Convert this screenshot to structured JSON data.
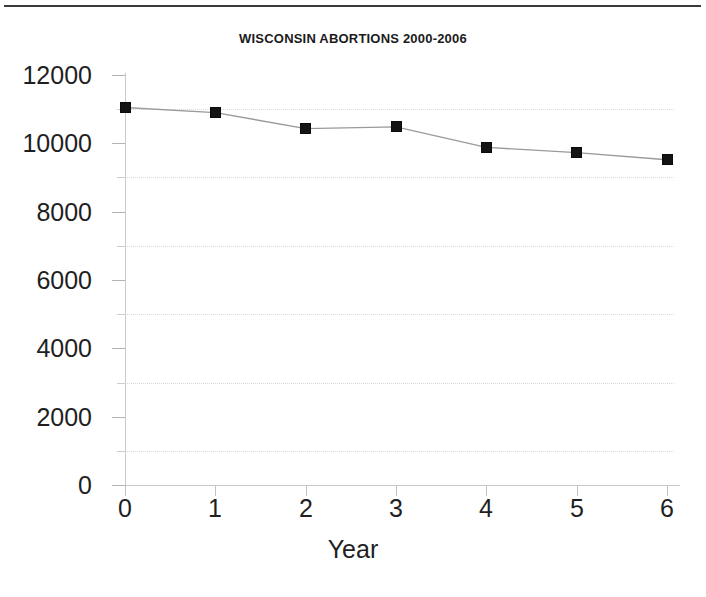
{
  "figure": {
    "top_rule": "horizontal-rule",
    "background": "#ffffff"
  },
  "chart_data": {
    "type": "line",
    "title": "WISCONSIN ABORTIONS 2000-2006",
    "xlabel": "Year",
    "ylabel": "",
    "x": [
      0,
      1,
      2,
      3,
      4,
      5,
      6
    ],
    "values": [
      11050,
      10900,
      10430,
      10480,
      9880,
      9730,
      9520
    ],
    "series": [
      {
        "name": "Wisconsin abortions",
        "values": [
          11050,
          10900,
          10430,
          10480,
          9880,
          9730,
          9520
        ]
      }
    ],
    "xlim": [
      0,
      6
    ],
    "ylim": [
      0,
      12000
    ],
    "x_ticks": [
      "0",
      "1",
      "2",
      "3",
      "4",
      "5",
      "6"
    ],
    "y_ticks": [
      "0",
      "2000",
      "4000",
      "6000",
      "8000",
      "10000",
      "12000"
    ],
    "y_minor_ticks": [
      1000,
      3000,
      5000,
      7000,
      9000,
      11000
    ],
    "gridlines": [
      1000,
      3000,
      5000,
      7000,
      9000,
      11000
    ],
    "grid": true,
    "grid_style": "dotted",
    "legend": null,
    "marker": "square",
    "marker_color": "#141414",
    "line_color": "#9a9a9a",
    "axis_color": "#c9c9c9"
  }
}
